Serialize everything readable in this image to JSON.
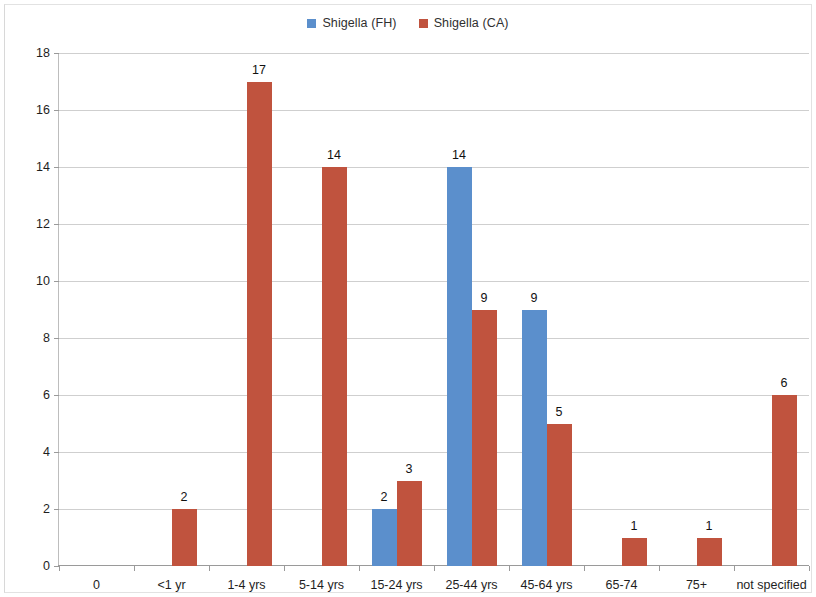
{
  "legend": {
    "position": "top-center",
    "items": [
      {
        "label": "Shigella (FH)",
        "color": "#5b8fcc",
        "key": "FH"
      },
      {
        "label": "Shigella (CA)",
        "color": "#c0533e",
        "key": "CA"
      }
    ]
  },
  "colors": {
    "series_fh": "#5b8fcc",
    "series_ca": "#c0533e",
    "gridline": "#cfcfcf",
    "axis": "#9a9a9a",
    "text": "#1e1e1e",
    "background": "#ffffff"
  },
  "chart_data": {
    "type": "bar",
    "title": "",
    "subtitle": "",
    "xlabel": "",
    "ylabel": "",
    "ylim": [
      0,
      18
    ],
    "yticks": [
      0,
      2,
      4,
      6,
      8,
      10,
      12,
      14,
      16,
      18
    ],
    "ytick_labels": [
      "0",
      "2",
      "4",
      "6",
      "8",
      "10",
      "12",
      "14",
      "16",
      "18"
    ],
    "grid": true,
    "legend_position": "top-center",
    "categories": [
      "0",
      "<1 yr",
      "1-4 yrs",
      "5-14 yrs",
      "15-24 yrs",
      "25-44 yrs",
      "45-64 yrs",
      "65-74",
      "75+",
      "not specified"
    ],
    "series": [
      {
        "name": "Shigella (FH)",
        "color": "#5b8fcc",
        "values": [
          null,
          null,
          null,
          null,
          2,
          14,
          9,
          null,
          null,
          null
        ],
        "labels": [
          "",
          "",
          "",
          "",
          "2",
          "14",
          "9",
          "",
          "",
          ""
        ]
      },
      {
        "name": "Shigella (CA)",
        "color": "#c0533e",
        "values": [
          null,
          2,
          17,
          14,
          3,
          9,
          5,
          1,
          1,
          6
        ],
        "labels": [
          "",
          "2",
          "17",
          "14",
          "3",
          "9",
          "5",
          "1",
          "1",
          "6"
        ]
      }
    ]
  }
}
